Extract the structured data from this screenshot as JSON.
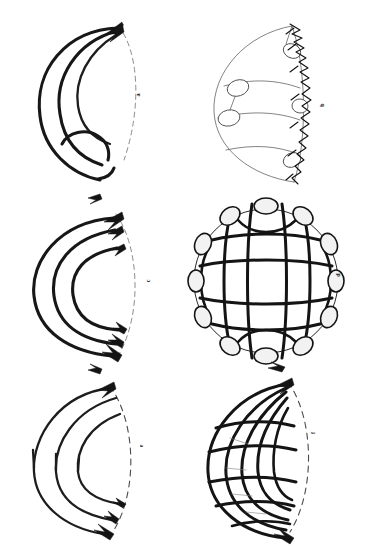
{
  "figure": {
    "background_color": "#ffffff",
    "ink_color": "#141414",
    "width": 371,
    "height": 559,
    "style": "scanned line drawing",
    "rows": 3,
    "columns": 2
  },
  "panels": [
    {
      "id": "a",
      "label": "a",
      "position": "top-left",
      "kind": "hemisphere-arcs",
      "description": "Three nested thick arcs converging to an arrowhead at the top pole, with a small extra arc near the bottom; dashed outer rim on the right.",
      "arc_count": 3,
      "arrowheads": 1,
      "nodes": 0
    },
    {
      "id": "b",
      "label": "b",
      "position": "top-right",
      "kind": "hemisphere-thin-network",
      "description": "Hemisphere outlined with thin lines, four small ellipse nodes on interior branch points, heavy scribbled ink along the right meridian.",
      "arc_count": 4,
      "arrowheads": 0,
      "nodes": 4
    },
    {
      "id": "c",
      "label": "c",
      "position": "middle-left",
      "kind": "hemisphere-arcs",
      "description": "Three nested thick C-shaped arcs with arrowheads at both the top and bottom ends, dashed outer rim on the right.",
      "arc_count": 3,
      "arrowheads": 6,
      "nodes": 0
    },
    {
      "id": "d",
      "label": "d",
      "position": "middle-right",
      "kind": "sphere-mesh",
      "description": "Full sphere drawn as a bold curvilinear grid of four meridians and four parallels, with twelve white ellipse nodes around the circular rim.",
      "meridians": 4,
      "parallels": 4,
      "nodes": 12
    },
    {
      "id": "e",
      "label": "e",
      "position": "bottom-left",
      "kind": "hemisphere-arcs",
      "description": "Three nested open C arcs, free ends at the left, arrowheads at the lower-right tips; dashed outer rim on the right.",
      "arc_count": 3,
      "arrowheads": 3,
      "nodes": 0
    },
    {
      "id": "f",
      "label": "f",
      "position": "bottom-right",
      "kind": "hemisphere-dense-mesh",
      "description": "Hemisphere filled with a dense bold mesh: nested U-shaped arcs crossed by radiating parallels, arrowheads at top and bottom of the meridian.",
      "arc_count": 5,
      "parallels": 5,
      "arrowheads": 2
    }
  ]
}
